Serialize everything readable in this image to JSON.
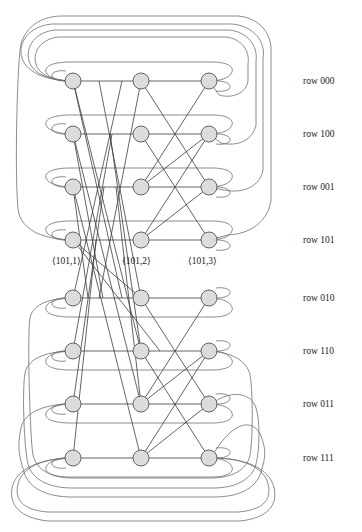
{
  "figure": {
    "type": "network-diagram",
    "name": "butterfly-network",
    "width": 362,
    "height": 532,
    "background": "#ffffff",
    "colors": {
      "node_fill": "#dcdcdc",
      "node_stroke": "#555555",
      "edge": "#3c3c3c",
      "arc": "#6e6e6e",
      "text": "#1a1a1a"
    }
  },
  "columns": [
    {
      "index": 1,
      "x": 73
    },
    {
      "index": 2,
      "x": 141
    },
    {
      "index": 3,
      "x": 209
    }
  ],
  "rows": [
    {
      "id": "r000",
      "label": "row 000",
      "bits": "000",
      "y": 81,
      "group": "top"
    },
    {
      "id": "r100",
      "label": "row 100",
      "bits": "100",
      "y": 134,
      "group": "top"
    },
    {
      "id": "r001",
      "label": "row 001",
      "bits": "001",
      "y": 187,
      "group": "top"
    },
    {
      "id": "r101",
      "label": "row 101",
      "bits": "101",
      "y": 240,
      "group": "top"
    },
    {
      "id": "r010",
      "label": "row 010",
      "bits": "010",
      "y": 298,
      "group": "bottom"
    },
    {
      "id": "r110",
      "label": "row 110",
      "bits": "110",
      "y": 351,
      "group": "bottom"
    },
    {
      "id": "r011",
      "label": "row 011",
      "bits": "011",
      "y": 404,
      "group": "bottom"
    },
    {
      "id": "r111",
      "label": "row 111",
      "bits": "111",
      "y": 458,
      "group": "bottom"
    }
  ],
  "row_labels_x": 303,
  "node_labels": [
    {
      "id": "n1",
      "text": "⟨101,1⟩",
      "x": 52,
      "y": 264,
      "anchor": "start"
    },
    {
      "id": "n2",
      "text": "⟨101,2⟩",
      "x": 122,
      "y": 264,
      "anchor": "start"
    },
    {
      "id": "n3",
      "text": "⟨101,3⟩",
      "x": 188,
      "y": 264,
      "anchor": "start"
    }
  ],
  "node_radius": 8,
  "legend": {
    "row_label_prefix": "row",
    "node_label_open": "⟨",
    "node_label_close": "⟩"
  }
}
